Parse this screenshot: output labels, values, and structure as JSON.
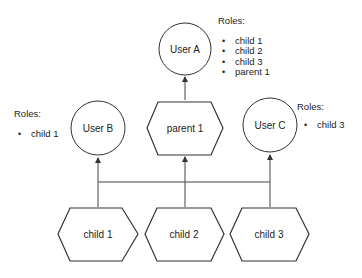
{
  "nodes": {
    "user_a": {
      "label": "User A",
      "shape": "circle"
    },
    "user_b": {
      "label": "User B",
      "shape": "circle"
    },
    "user_c": {
      "label": "User C",
      "shape": "circle"
    },
    "parent_1": {
      "label": "parent 1",
      "shape": "hexagon"
    },
    "child_1": {
      "label": "child 1",
      "shape": "hexagon"
    },
    "child_2": {
      "label": "child 2",
      "shape": "hexagon"
    },
    "child_3": {
      "label": "child 3",
      "shape": "hexagon"
    }
  },
  "roles": {
    "user_a": {
      "title": "Roles:",
      "items": [
        "child 1",
        "child 2",
        "child 3",
        "parent 1"
      ]
    },
    "user_b": {
      "title": "Roles:",
      "items": [
        "child 1"
      ]
    },
    "user_c": {
      "title": "Roles:",
      "items": [
        "child 3"
      ]
    }
  },
  "edges": [
    {
      "from": "parent_1",
      "to": "user_a"
    },
    {
      "from": "child_1",
      "to": "user_b"
    },
    {
      "from": "child_2",
      "to": "parent_1"
    },
    {
      "from": "child_3",
      "to": "user_c"
    },
    {
      "from": "children_bus",
      "to": "all_children"
    }
  ],
  "colors": {
    "stroke": "#333333",
    "text": "#222222",
    "background": "#ffffff"
  }
}
